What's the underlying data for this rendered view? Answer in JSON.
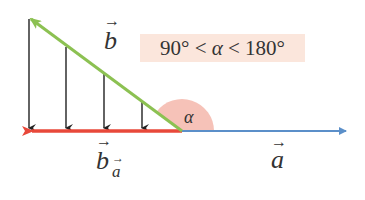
{
  "diagram": {
    "condition": {
      "text": "90° < α < 180°",
      "left": "90° < ",
      "var": "α",
      "right": " < 180°"
    },
    "labels": {
      "vector_b": "b",
      "vector_a": "a",
      "projection": "b",
      "projection_sub": "a",
      "angle": "α"
    },
    "colors": {
      "vector_a": "#5b8fc9",
      "vector_b": "#8cc152",
      "projection": "#e8483a",
      "angle_fill": "#f6c2b8",
      "drop_lines": "#222222",
      "condition_bg": "#fbe6dc"
    },
    "drop_lines_x": [
      29,
      66,
      104,
      142
    ]
  }
}
